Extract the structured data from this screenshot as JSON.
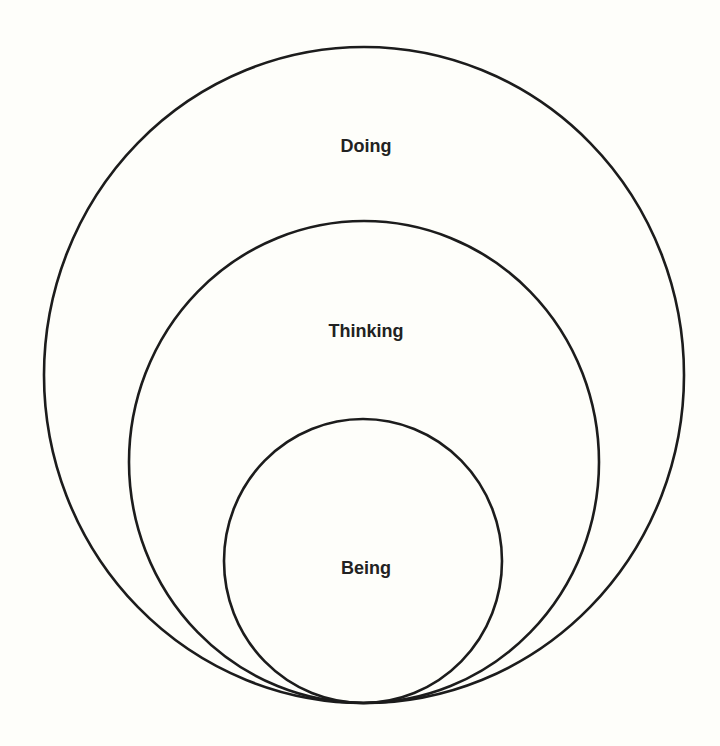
{
  "diagram": {
    "type": "nested-circles",
    "background": "#fefefa",
    "stroke_color": "#1c1c1c",
    "text_color": "#222222",
    "tangent_point": {
      "x": 364,
      "y": 703
    },
    "circles": [
      {
        "id": "doing",
        "label": "Doing",
        "cx": 364,
        "cy": 375,
        "rx": 320,
        "ry": 328,
        "label_x": 366,
        "label_y": 152
      },
      {
        "id": "thinking",
        "label": "Thinking",
        "cx": 364,
        "cy": 462,
        "rx": 235,
        "ry": 241,
        "label_x": 366,
        "label_y": 337
      },
      {
        "id": "being",
        "label": "Being",
        "cx": 363,
        "cy": 561,
        "rx": 139,
        "ry": 142,
        "label_x": 366,
        "label_y": 574
      }
    ],
    "relationship": "Being is contained within Thinking, which is contained within Doing; all three circles share a common tangent point at the bottom."
  }
}
